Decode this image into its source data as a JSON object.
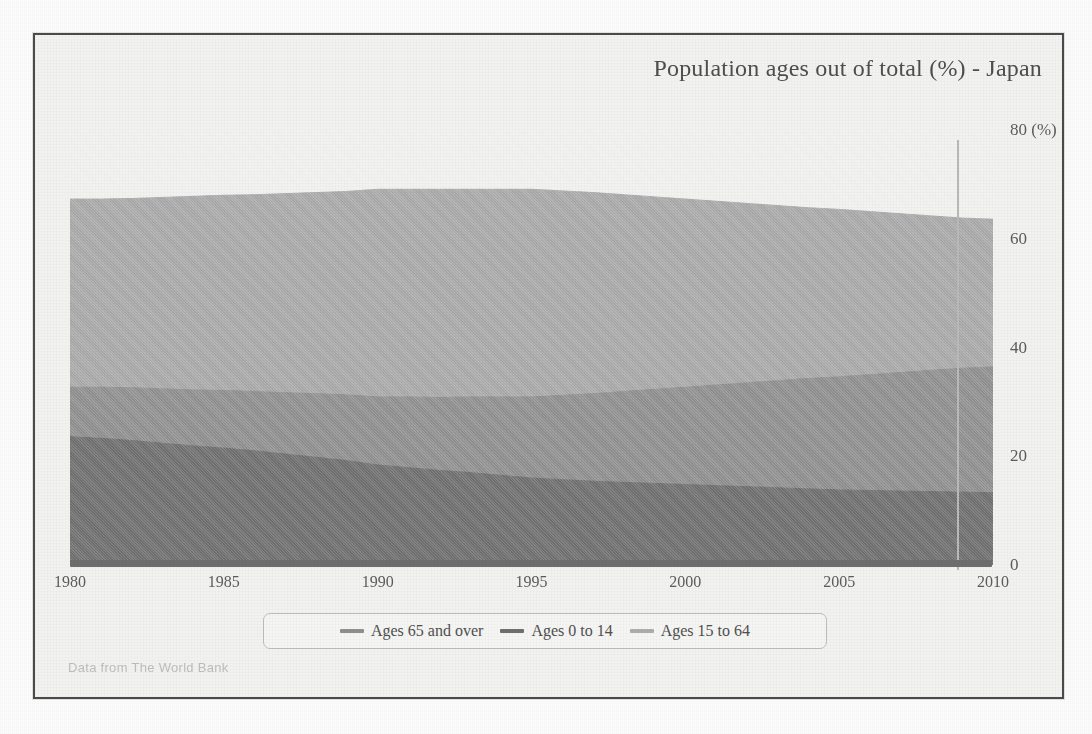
{
  "chart_title": "Population ages out of total (%) - Japan",
  "source_note": "Data from The World Bank",
  "axes": {
    "y_unit_label": "80 (%)",
    "y_ticks": [
      "0",
      "20",
      "40",
      "60",
      "80 (%)"
    ],
    "y_tick_values": [
      0,
      20,
      40,
      60,
      80
    ],
    "x_ticks": [
      "1980",
      "1985",
      "1990",
      "1995",
      "2000",
      "2005",
      "2010"
    ],
    "x_tick_values": [
      1980,
      1985,
      1990,
      1995,
      2000,
      2005,
      2010
    ]
  },
  "legend": {
    "items": [
      {
        "label": "Ages 65 and over",
        "color": "#8f8f8f"
      },
      {
        "label": "Ages 0 to 14",
        "color": "#6f6f6f"
      },
      {
        "label": "Ages 15 to 64",
        "color": "#adadad"
      }
    ]
  },
  "colors": {
    "frame_border": "#4a4a4a",
    "panel_bg": "#f2f2f0",
    "axis_line": "#b9b9b7",
    "baseline_bar": "#6e6e6e",
    "band_ages_0_14": "#767676",
    "band_ages_65_over": "#949494",
    "band_ages_15_64": "#adadad",
    "title_text": "#4e4e4e",
    "tick_text": "#5c5c5c",
    "source_text": "#bdbdbb"
  },
  "chart_data": {
    "type": "area",
    "title": "Population ages out of total (%) - Japan",
    "xlabel": "",
    "ylabel": "(%)",
    "xlim": [
      1980,
      2010
    ],
    "ylim": [
      0,
      80
    ],
    "grid": false,
    "legend_position": "bottom",
    "stacking": "Ages 0 to 14 and Ages 65 and over are stacked from the baseline; Ages 15 to 64 is drawn as its own area from the baseline and overlays them",
    "x": [
      1980,
      1981,
      1982,
      1983,
      1984,
      1985,
      1986,
      1987,
      1988,
      1989,
      1990,
      1991,
      1992,
      1993,
      1994,
      1995,
      1996,
      1997,
      1998,
      1999,
      2000,
      2001,
      2002,
      2003,
      2004,
      2005,
      2006,
      2007,
      2008,
      2009,
      2010
    ],
    "series": [
      {
        "name": "Ages 0 to 14",
        "color": "#767676",
        "values": [
          23.6,
          23.3,
          22.9,
          22.4,
          21.9,
          21.5,
          21.0,
          20.4,
          19.8,
          19.2,
          18.4,
          17.9,
          17.4,
          17.0,
          16.5,
          16.0,
          15.7,
          15.4,
          15.2,
          15.0,
          14.8,
          14.6,
          14.4,
          14.2,
          14.0,
          13.8,
          13.7,
          13.6,
          13.5,
          13.4,
          13.3
        ]
      },
      {
        "name": "Ages 65 and over",
        "color": "#949494",
        "values": [
          9.1,
          9.4,
          9.7,
          10.0,
          10.3,
          10.6,
          10.9,
          11.3,
          11.7,
          12.1,
          12.5,
          13.0,
          13.4,
          13.9,
          14.4,
          14.9,
          15.5,
          16.1,
          16.7,
          17.3,
          17.9,
          18.5,
          19.1,
          19.7,
          20.3,
          20.8,
          21.3,
          21.8,
          22.3,
          22.8,
          23.1
        ]
      },
      {
        "name": "Ages 15 to 64",
        "color": "#adadad",
        "values": [
          67.3,
          67.3,
          67.4,
          67.6,
          67.8,
          68.0,
          68.1,
          68.3,
          68.5,
          68.7,
          69.1,
          69.1,
          69.1,
          69.1,
          69.1,
          69.1,
          68.8,
          68.5,
          68.1,
          67.7,
          67.3,
          66.9,
          66.5,
          66.1,
          65.7,
          65.4,
          65.0,
          64.6,
          64.2,
          63.8,
          63.6
        ]
      }
    ]
  }
}
